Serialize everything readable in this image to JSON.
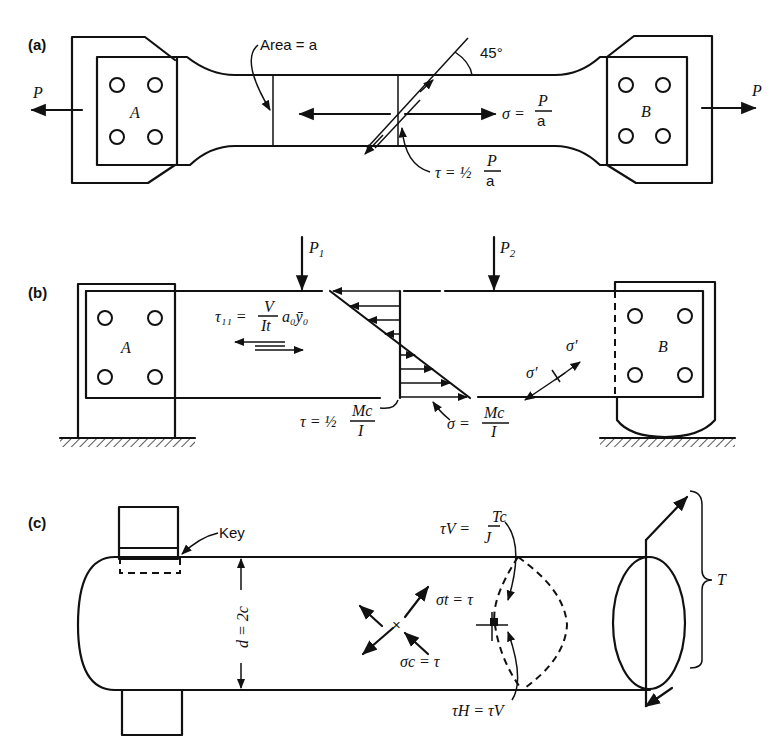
{
  "panels": {
    "a": {
      "label": "(a)",
      "area_label": "Area = a",
      "angle_label": "45°",
      "load_left": "P",
      "load_right": "P",
      "grip_left": "A",
      "grip_right": "B",
      "normal_stress": {
        "lhs": "σ =",
        "num": "P",
        "den": "a"
      },
      "shear_stress": {
        "lhs": "τ = ½",
        "num": "P",
        "den": "a"
      }
    },
    "b": {
      "label": "(b)",
      "load_1": "P",
      "load_1_sub": "1",
      "load_2": "P",
      "load_2_sub": "2",
      "support_left": "A",
      "support_right": "B",
      "horizontal_shear": {
        "lhs": "τ₁₁ =",
        "num": "V",
        "den": "It",
        "tail": "a₀ȳ₀"
      },
      "shear_at_base": {
        "lhs": "τ = ½",
        "num": "Mc",
        "den": "I"
      },
      "bending_stress": {
        "lhs": "σ =",
        "num": "Mc",
        "den": "I"
      },
      "principal_1": "σ′",
      "principal_2": "σ′"
    },
    "c": {
      "label": "(c)",
      "key_label": "Key",
      "diameter_label": "d = 2c",
      "torque_label": "T",
      "vertical_shear": {
        "lhs": "τV =",
        "num": "Tc",
        "den": "J"
      },
      "tension": "σt = τ",
      "compression": "σc = τ",
      "horizontal_shear": "τH = τV"
    }
  }
}
